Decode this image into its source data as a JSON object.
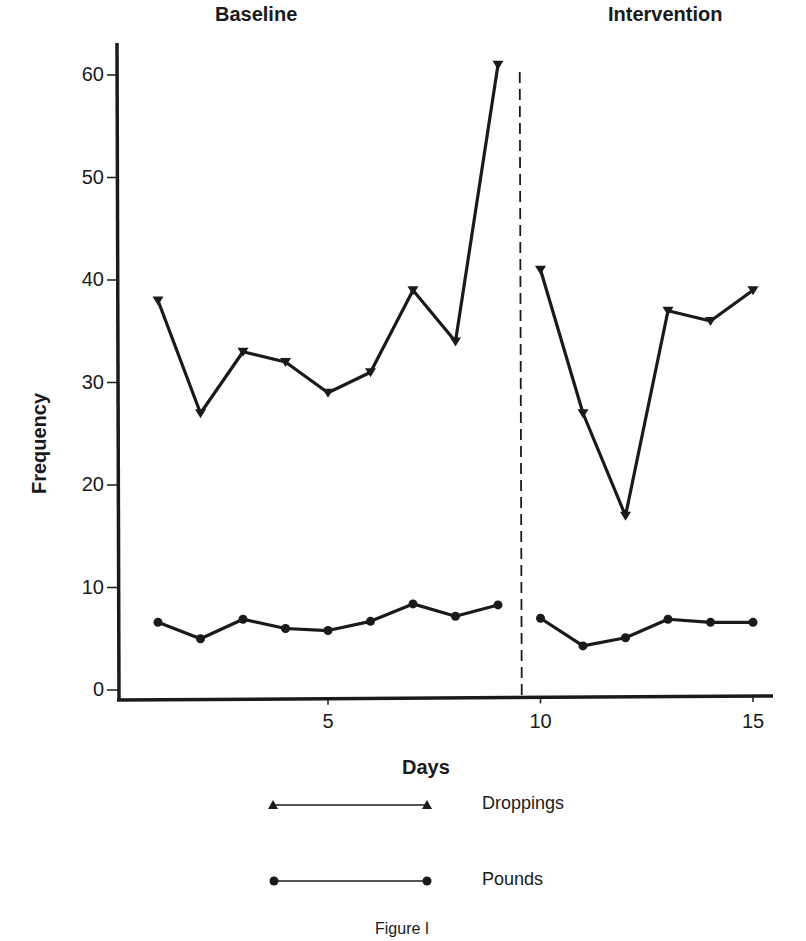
{
  "chart_data": {
    "type": "line",
    "title": "",
    "caption": "Figure I",
    "xlabel": "Days",
    "ylabel": "Frequency",
    "xlim": [
      0,
      15.5
    ],
    "ylim": [
      0,
      62
    ],
    "x_ticks": [
      5,
      10,
      15
    ],
    "y_ticks": [
      0,
      10,
      20,
      30,
      40,
      50,
      60
    ],
    "grid": false,
    "legend_position": "bottom",
    "phases": [
      {
        "label": "Baseline",
        "days": [
          1,
          9
        ]
      },
      {
        "label": "Intervention",
        "days": [
          10,
          15
        ]
      }
    ],
    "phase_change_line": {
      "x": 9.5,
      "style": "dashed"
    },
    "x": [
      1,
      2,
      3,
      4,
      5,
      6,
      7,
      8,
      9,
      10,
      11,
      12,
      13,
      14,
      15
    ],
    "series": [
      {
        "name": "Droppings",
        "marker": "triangle",
        "values": [
          38,
          27,
          33,
          32,
          29,
          31,
          39,
          34,
          61,
          41,
          27,
          17,
          37,
          36,
          39
        ]
      },
      {
        "name": "Pounds",
        "marker": "circle",
        "values": [
          6.6,
          5.0,
          6.9,
          6.0,
          5.8,
          6.7,
          8.4,
          7.2,
          8.3,
          7.0,
          4.3,
          5.1,
          6.9,
          6.6,
          6.6
        ]
      }
    ]
  },
  "labels": {
    "baseline": "Baseline",
    "intervention": "Intervention",
    "xlabel": "Days",
    "ylabel": "Frequency",
    "caption": "Figure I",
    "legend_droppings": "Droppings",
    "legend_pounds": "Pounds"
  },
  "colors": {
    "ink": "#1a1a1a",
    "background": "#ffffff"
  }
}
